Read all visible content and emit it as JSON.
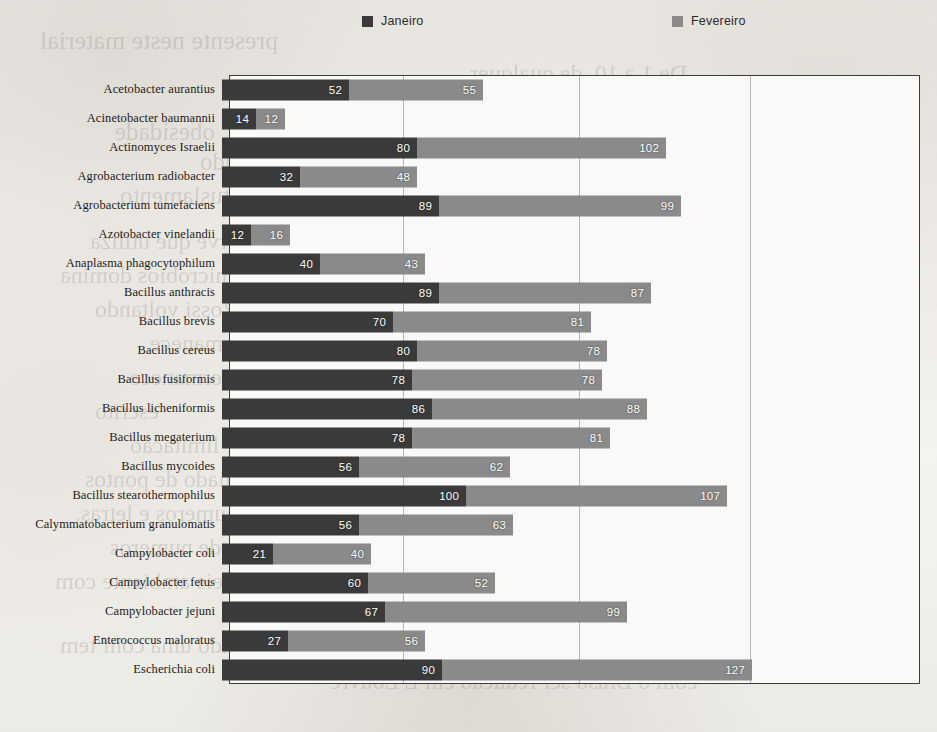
{
  "legend": {
    "entries": [
      {
        "label": "Janeiro",
        "color": "#3a3a3a"
      },
      {
        "label": "Fevereiro",
        "color": "#8a8a8a"
      }
    ]
  },
  "axis": {
    "gridline_values": [
      0,
      71,
      143,
      213
    ],
    "max_total": 240,
    "scale_px_per_unit": 2.44
  },
  "bleed_text": [
    {
      "text": "presente neste material",
      "x": 40,
      "y": 26,
      "size": 26
    },
    {
      "text": "De 1 a 10, de qualquer",
      "x": 470,
      "y": 60,
      "size": 24
    },
    {
      "text": "obesidade",
      "x": 115,
      "y": 118,
      "size": 25
    },
    {
      "text": "Reservado",
      "x": 200,
      "y": 148,
      "size": 25
    },
    {
      "text": "nosebtuslamento",
      "x": 120,
      "y": 182,
      "size": 25
    },
    {
      "text": "Projeto no relato se serve que utiliza",
      "x": 90,
      "y": 228,
      "size": 24
    },
    {
      "text": "ja localizado dos microbios domina",
      "x": 60,
      "y": 262,
      "size": 24
    },
    {
      "text": "Rossi voltando",
      "x": 95,
      "y": 296,
      "size": 24
    },
    {
      "text": "Parcela da permanece",
      "x": 150,
      "y": 330,
      "size": 24
    },
    {
      "text": "Item permanece",
      "x": 130,
      "y": 364,
      "size": 24
    },
    {
      "text": "escrito",
      "x": 95,
      "y": 398,
      "size": 24
    },
    {
      "text": "O das tribo de limitacao",
      "x": 130,
      "y": 432,
      "size": 24
    },
    {
      "text": "e telas, auxiliado de pontos",
      "x": 85,
      "y": 466,
      "size": 24
    },
    {
      "text": "acompanhado de numeros e letras.",
      "x": 75,
      "y": 500,
      "size": 24
    },
    {
      "text": "Os pontos em seis de numeros",
      "x": 110,
      "y": 534,
      "size": 24
    },
    {
      "text": "bios virtos em seis ambiente com",
      "x": 55,
      "y": 568,
      "size": 24
    },
    {
      "text": "aspecto realizando uma conf tem",
      "x": 60,
      "y": 632,
      "size": 24
    },
    {
      "text": "com o Braso ser reducao em L Louvre",
      "x": 330,
      "y": 668,
      "size": 24
    }
  ],
  "chart_data": {
    "type": "bar",
    "orientation": "horizontal",
    "stacked": true,
    "title": "",
    "xlabel": "",
    "ylabel": "",
    "grid": true,
    "legend_position": "top",
    "categories": [
      "Acetobacter aurantius",
      "Acinetobacter baumannii",
      "Actinomyces Israelii",
      "Agrobacterium radiobacter",
      "Agrobacterium tumefaciens",
      "Azotobacter vinelandii",
      "Anaplasma phagocytophilum",
      "Bacillus anthracis",
      "Bacillus brevis",
      "Bacillus cereus",
      "Bacillus fusiformis",
      "Bacillus licheniformis",
      "Bacillus megaterium",
      "Bacillus mycoides",
      "Bacillus stearothermophilus",
      "Calymmatobacterium granulomatis",
      "Campylobacter coli",
      "Campylobacter fetus",
      "Campylobacter jejuni",
      "Enterococcus maloratus",
      "Escherichia coli"
    ],
    "series": [
      {
        "name": "Janeiro",
        "color": "#3a3a3a",
        "values": [
          52,
          14,
          80,
          32,
          89,
          12,
          40,
          89,
          70,
          80,
          78,
          86,
          78,
          56,
          100,
          56,
          21,
          60,
          67,
          27,
          90
        ]
      },
      {
        "name": "Fevereiro",
        "color": "#8a8a8a",
        "values": [
          55,
          12,
          102,
          48,
          99,
          16,
          43,
          87,
          81,
          78,
          78,
          88,
          81,
          62,
          107,
          63,
          40,
          52,
          99,
          56,
          127
        ]
      }
    ]
  }
}
